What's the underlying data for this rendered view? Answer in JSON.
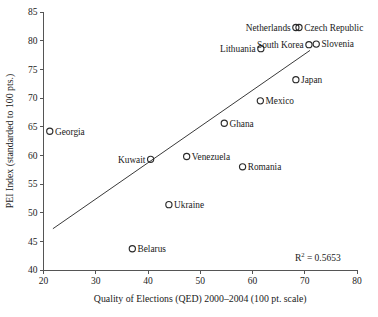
{
  "chart_data": {
    "type": "scatter",
    "title": "",
    "xlabel": "Quality of Elections (QED) 2000–2004 (100 pt. scale)",
    "ylabel": "PEI Index (standarded to 100 pts.)",
    "xlim": [
      20,
      80
    ],
    "ylim": [
      40,
      85
    ],
    "xticks": [
      20,
      30,
      40,
      50,
      60,
      70,
      80
    ],
    "xtick_labels": [
      "20",
      "30",
      "40",
      "50",
      "60",
      "70",
      "80"
    ],
    "yticks": [
      40,
      45,
      50,
      55,
      60,
      65,
      70,
      75,
      80,
      85
    ],
    "ytick_labels": [
      "40",
      "45",
      "50",
      "55",
      "60",
      "65",
      "70",
      "75",
      "80",
      "85"
    ],
    "grid": false,
    "legend": null,
    "annotations": [
      {
        "name": "r-squared",
        "text": "R2 = 0.5653",
        "base": "R",
        "sup": "2",
        "rest": " = 0.5653",
        "value": 0.5653,
        "x": 72.5,
        "y": 41.6
      }
    ],
    "trendline": {
      "name": "linear-fit",
      "x1": 21.8,
      "y1": 47.2,
      "x2": 71.0,
      "y2": 78.3
    },
    "points": [
      {
        "label": "Georgia",
        "x": 21.2,
        "y": 64.2,
        "label_side": "right"
      },
      {
        "label": "Kuwait",
        "x": 40.5,
        "y": 59.3,
        "label_side": "left"
      },
      {
        "label": "Belarus",
        "x": 37.0,
        "y": 43.7,
        "label_side": "right"
      },
      {
        "label": "Ukraine",
        "x": 44.0,
        "y": 51.4,
        "label_side": "right"
      },
      {
        "label": "Venezuela",
        "x": 47.4,
        "y": 59.8,
        "label_side": "right"
      },
      {
        "label": "Ghana",
        "x": 54.6,
        "y": 65.6,
        "label_side": "right"
      },
      {
        "label": "Romania",
        "x": 58.1,
        "y": 58.0,
        "label_side": "right"
      },
      {
        "label": "Mexico",
        "x": 61.5,
        "y": 69.5,
        "label_side": "right"
      },
      {
        "label": "Lithuania",
        "x": 61.6,
        "y": 78.6,
        "label_side": "left"
      },
      {
        "label": "Japan",
        "x": 68.3,
        "y": 73.2,
        "label_side": "right"
      },
      {
        "label": "Netherlands",
        "x": 68.3,
        "y": 82.3,
        "label_side": "left"
      },
      {
        "label": "Czech Republic",
        "x": 68.9,
        "y": 82.3,
        "label_side": "right"
      },
      {
        "label": "South Korea",
        "x": 70.8,
        "y": 79.3,
        "label_side": "left"
      },
      {
        "label": "Slovenia",
        "x": 72.2,
        "y": 79.4,
        "label_side": "right"
      }
    ]
  }
}
